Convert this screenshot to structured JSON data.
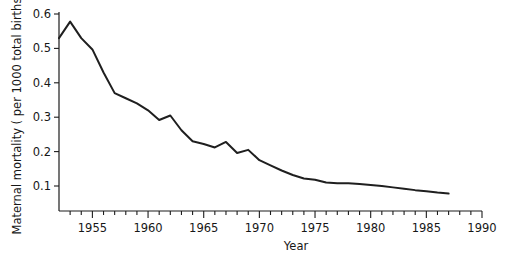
{
  "chart_data": {
    "type": "line",
    "title": "",
    "xlabel": "Year",
    "ylabel": "Maternal mortality ( per 1000 total births )",
    "xlim": [
      1952,
      1990
    ],
    "ylim": [
      0,
      0.625
    ],
    "grid": false,
    "legend": null,
    "x_ticks_major": [
      1955,
      1960,
      1965,
      1970,
      1975,
      1980,
      1985,
      1990
    ],
    "x_tick_labels": [
      "1955",
      "1960",
      "1965",
      "1970",
      "1975",
      "1980",
      "1985",
      "1990"
    ],
    "x_ticks_minor_step": 1,
    "y_ticks": [
      0.1,
      0.2,
      0.3,
      0.4,
      0.5,
      0.6
    ],
    "y_tick_labels": [
      "0.1",
      "0.2",
      "0.3",
      "0.4",
      "0.5",
      "0.6"
    ],
    "series": [
      {
        "name": "Maternal mortality rate",
        "color": "#1f1f1f",
        "x": [
          1952,
          1953,
          1954,
          1955,
          1956,
          1957,
          1958,
          1959,
          1960,
          1961,
          1962,
          1963,
          1964,
          1965,
          1966,
          1967,
          1968,
          1969,
          1970,
          1971,
          1972,
          1973,
          1974,
          1975,
          1976,
          1977,
          1978,
          1979,
          1980,
          1981,
          1982,
          1983,
          1984,
          1985,
          1986,
          1987
        ],
        "values": [
          0.53,
          0.578,
          0.53,
          0.497,
          0.43,
          0.37,
          0.355,
          0.34,
          0.32,
          0.292,
          0.305,
          0.262,
          0.23,
          0.222,
          0.212,
          0.228,
          0.196,
          0.205,
          0.175,
          0.16,
          0.145,
          0.132,
          0.122,
          0.118,
          0.11,
          0.108,
          0.108,
          0.106,
          0.103,
          0.1,
          0.096,
          0.092,
          0.088,
          0.085,
          0.081,
          0.078
        ]
      }
    ],
    "annotations": []
  },
  "axis_titles": {
    "x": "Year",
    "y": "Maternal mortality ( per 1000 total births )"
  }
}
